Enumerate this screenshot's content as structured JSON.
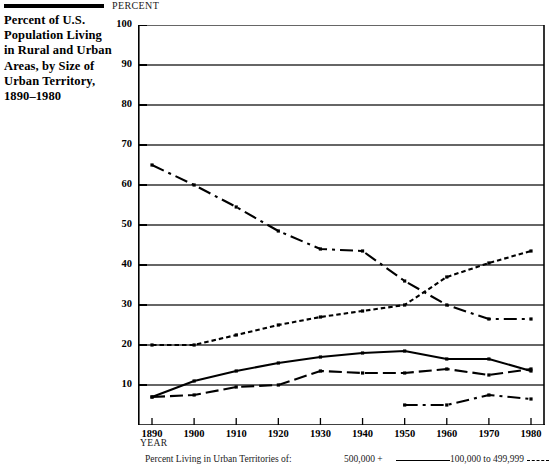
{
  "page_title": "Percent of U.S. Population Living in Rural and Urban Areas, by Size of Urban Territory, 1890–1980",
  "axis": {
    "ylabel": "PERCENT",
    "xlabel": "YEAR"
  },
  "legend": {
    "caption": "Percent Living in Urban Territories of:",
    "entry_1": "500,000 +",
    "entry_2": "100,000 to 499,999"
  },
  "chart_data": {
    "type": "line",
    "title": "Percent of U.S. Population Living in Rural and Urban Areas, by Size of Urban Territory, 1890–1980",
    "xlabel": "YEAR",
    "ylabel": "PERCENT",
    "xlim": [
      1890,
      1980
    ],
    "ylim": [
      0,
      100
    ],
    "yticks": [
      10,
      20,
      30,
      40,
      50,
      60,
      70,
      80,
      90,
      100
    ],
    "xticks": [
      1890,
      1900,
      1910,
      1920,
      1930,
      1940,
      1950,
      1960,
      1970,
      1980
    ],
    "grid": "horizontal",
    "legend_position": "below-axis",
    "x": [
      1890,
      1900,
      1910,
      1920,
      1930,
      1940,
      1950,
      1960,
      1970,
      1980
    ],
    "series": [
      {
        "name": "Rural",
        "style": "dash-dot",
        "values": [
          65,
          60,
          54.5,
          48.5,
          44,
          43.5,
          36,
          30,
          26.5,
          26.5
        ]
      },
      {
        "name": "500,000 +",
        "style": "dotted",
        "values": [
          20,
          20,
          22.5,
          25,
          27,
          28.5,
          30,
          37,
          40.5,
          43.5
        ]
      },
      {
        "name": "100,000 to 499,999",
        "style": "solid",
        "values": [
          7,
          11,
          13.5,
          15.5,
          17,
          18,
          18.5,
          16.5,
          16.5,
          13.5
        ]
      },
      {
        "name": "Urban territory mid-size",
        "style": "dashed",
        "values": [
          7,
          7.5,
          9.5,
          10,
          13.5,
          13,
          13,
          14,
          12.5,
          14
        ]
      },
      {
        "name": "Urban territory small",
        "style": "dash-dot",
        "x": [
          1950,
          1960,
          1970,
          1980
        ],
        "values": [
          5,
          5,
          7.5,
          6.5
        ]
      }
    ]
  },
  "colors": {
    "ink": "#000000",
    "background": "#ffffff",
    "grid": "#333333"
  }
}
